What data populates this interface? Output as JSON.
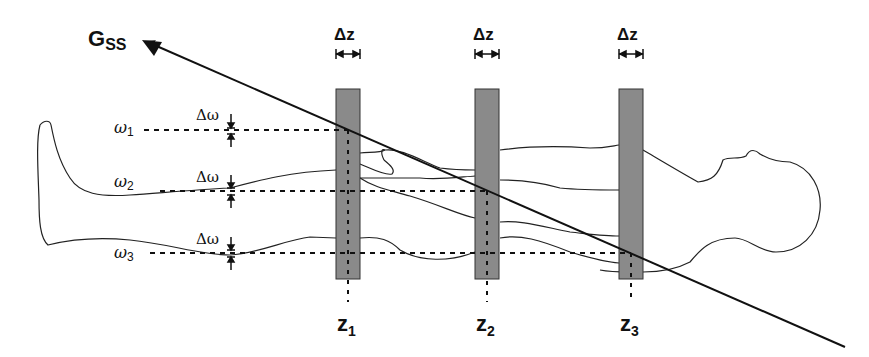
{
  "diagram": {
    "gradient_label": {
      "main": "G",
      "sub": "SS"
    },
    "slice_thickness_label": "Δz",
    "bandwidth_label": "Δω",
    "frequencies": [
      {
        "symbol": "ω",
        "index": "1"
      },
      {
        "symbol": "ω",
        "index": "2"
      },
      {
        "symbol": "ω",
        "index": "3"
      }
    ],
    "slices": [
      {
        "symbol": "z",
        "index": "1"
      },
      {
        "symbol": "z",
        "index": "2"
      },
      {
        "symbol": "z",
        "index": "3"
      }
    ],
    "colors": {
      "slice_fill": "#8a8a8a",
      "line": "#111111",
      "background": "#ffffff"
    }
  }
}
